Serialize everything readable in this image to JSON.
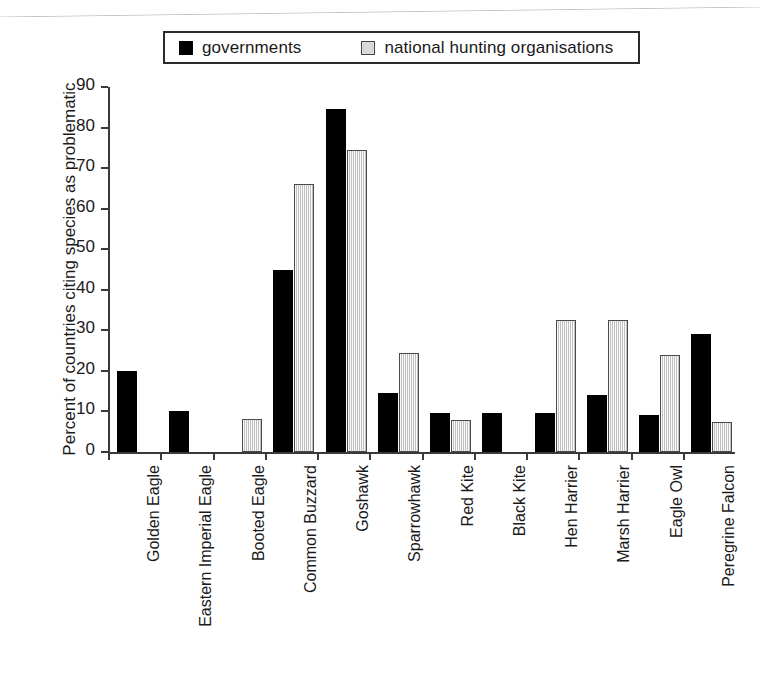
{
  "legend": {
    "entries": [
      {
        "label": "governments",
        "key": "governments",
        "color": "#000000",
        "swatch": "solid-black"
      },
      {
        "label": "national hunting organisations",
        "key": "hunting",
        "color": "#d9d9d9",
        "swatch": "light-grey-striped"
      }
    ]
  },
  "axes": {
    "y_title": "Percent of countries citing species as problematic",
    "y_ticks": [
      "0",
      "10",
      "20",
      "30",
      "40",
      "50",
      "60",
      "70",
      "80",
      "90"
    ],
    "x_title": ""
  },
  "chart_data": {
    "type": "bar",
    "title": "",
    "xlabel": "",
    "ylabel": "Percent of countries citing species as problematic",
    "ylim": [
      0,
      90
    ],
    "ytick_step": 10,
    "grid": false,
    "legend_position": "top",
    "categories": [
      "Golden Eagle",
      "Eastern Imperial Eagle",
      "Booted Eagle",
      "Common Buzzard",
      "Goshawk",
      "Sparrowhawk",
      "Red Kite",
      "Black Kite",
      "Hen Harrier",
      "Marsh Harrier",
      "Eagle Owl",
      "Peregrine Falcon"
    ],
    "series": [
      {
        "name": "governments",
        "color": "#000000",
        "values": [
          20,
          10,
          0,
          44.8,
          84.5,
          14.5,
          9.7,
          9.6,
          9.5,
          14.1,
          9.1,
          29
        ]
      },
      {
        "name": "national hunting organisations",
        "color": "#d9d9d9",
        "values": [
          0,
          0,
          8.2,
          66,
          74.5,
          24.4,
          7.8,
          0,
          32.5,
          32.5,
          24,
          7.3
        ]
      }
    ]
  }
}
